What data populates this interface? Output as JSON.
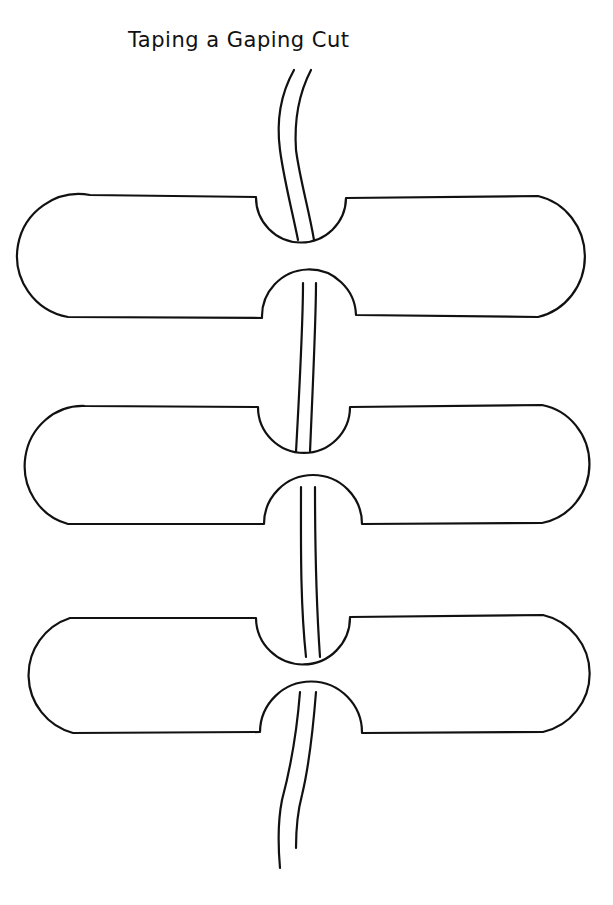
{
  "title": "Taping a Gaping Cut",
  "figure": {
    "strips": [
      {
        "label": "strip-1"
      },
      {
        "label": "strip-2"
      },
      {
        "label": "strip-3"
      }
    ],
    "colors": {
      "line": "#111111",
      "background": "#ffffff"
    }
  }
}
